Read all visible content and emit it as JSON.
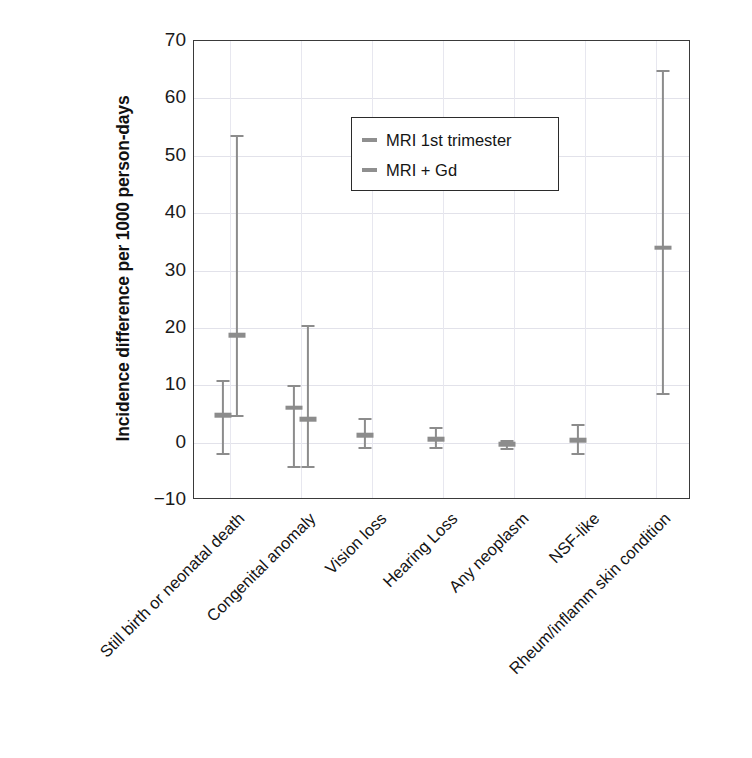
{
  "chart_data": {
    "type": "scatter",
    "title": "",
    "xlabel": "",
    "ylabel": "Incidence difference per 1000 person-days",
    "ylim": [
      -10,
      70
    ],
    "yticks": [
      -10,
      0,
      10,
      20,
      30,
      40,
      50,
      60,
      70
    ],
    "ytick_labels": [
      "−10",
      "0",
      "10",
      "20",
      "30",
      "40",
      "50",
      "60",
      "70"
    ],
    "grid": true,
    "legend_position": "upper center",
    "categories": [
      "Still birth or neonatal death",
      "Congenital anomaly",
      "Vision loss",
      "Hearing Loss",
      "Any neoplasm",
      "NSF-like",
      "Rheum/inflamm skin condition"
    ],
    "series": [
      {
        "name": "MRI 1st trimester",
        "color": "#8c8c8c",
        "values": [
          4.8,
          6.1,
          1.3,
          0.6,
          -0.3,
          0.4,
          null
        ],
        "ci_low": [
          -1.8,
          -4.0,
          -0.8,
          -0.7,
          -0.9,
          -1.8,
          null
        ],
        "ci_high": [
          11.0,
          10.0,
          4.3,
          2.8,
          0.4,
          3.3,
          null
        ]
      },
      {
        "name": "MRI + Gd",
        "color": "#8c8c8c",
        "values": [
          18.7,
          4.1,
          null,
          null,
          null,
          null,
          34.0
        ],
        "ci_low": [
          4.8,
          -4.0,
          null,
          null,
          null,
          null,
          8.6
        ],
        "ci_high": [
          53.7,
          20.5,
          null,
          null,
          null,
          null,
          65.0
        ]
      }
    ]
  },
  "legend": {
    "items": [
      {
        "label": "MRI 1st trimester"
      },
      {
        "label": "MRI + Gd"
      }
    ]
  },
  "axis": {
    "ylabel": "Incidence difference per 1000 person-days"
  },
  "colors": {
    "bar": "#8c8c8c",
    "axis": "#3a3a3a",
    "grid": "#e2e2ea",
    "text": "#141414"
  }
}
